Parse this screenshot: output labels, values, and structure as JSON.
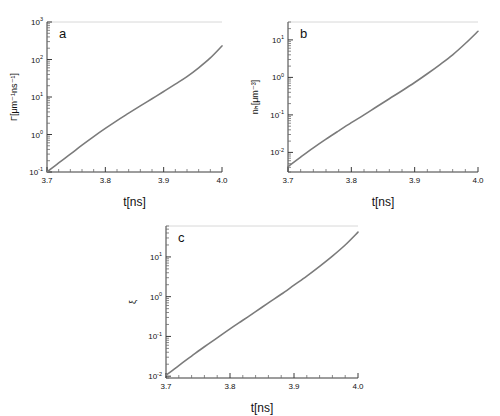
{
  "figure": {
    "background": "#ffffff",
    "curve_color": "#7b7b7b",
    "axis_color": "#3a3a3a",
    "panel_letters": [
      "a",
      "b",
      "c"
    ]
  },
  "chart_data": [
    {
      "type": "line",
      "panel": "a",
      "title": "",
      "xlabel": "t[ns]",
      "ylabel": "Γ[μm⁻¹ns⁻¹]",
      "xlim": [
        3.7,
        4.0
      ],
      "ylim": [
        0.1,
        1000
      ],
      "yscale": "log",
      "xscale": "linear",
      "grid": false,
      "legend": null,
      "xticks": [
        3.7,
        3.8,
        3.9,
        4.0
      ],
      "xticklabels": [
        "3.7",
        "3.8",
        "3.9",
        "4.0"
      ],
      "yticks": [
        0.1,
        1,
        10,
        100,
        1000
      ],
      "yticklabels": [
        "10⁻¹",
        "10⁰",
        "10¹",
        "10²",
        "10³"
      ],
      "x": [
        3.7,
        3.72,
        3.74,
        3.76,
        3.78,
        3.8,
        3.82,
        3.84,
        3.86,
        3.88,
        3.9,
        3.92,
        3.94,
        3.96,
        3.98,
        4.0
      ],
      "y": [
        0.1,
        0.175,
        0.3,
        0.52,
        0.88,
        1.45,
        2.35,
        3.7,
        5.8,
        9.0,
        14.0,
        22.0,
        35.0,
        60.0,
        110.0,
        230.0
      ]
    },
    {
      "type": "line",
      "panel": "b",
      "title": "",
      "xlabel": "t[ns]",
      "ylabel": "nₕ[μm⁻³]",
      "xlim": [
        3.7,
        4.0
      ],
      "ylim": [
        0.003,
        30
      ],
      "yscale": "log",
      "xscale": "linear",
      "grid": false,
      "legend": null,
      "xticks": [
        3.7,
        3.8,
        3.9,
        4.0
      ],
      "xticklabels": [
        "3.7",
        "3.8",
        "3.9",
        "4.0"
      ],
      "yticks": [
        0.01,
        0.1,
        1,
        10
      ],
      "yticklabels": [
        "10⁻²",
        "10⁻¹",
        "10⁰",
        "10¹"
      ],
      "x": [
        3.7,
        3.72,
        3.74,
        3.76,
        3.78,
        3.8,
        3.82,
        3.84,
        3.86,
        3.88,
        3.9,
        3.92,
        3.94,
        3.96,
        3.98,
        4.0
      ],
      "y": [
        0.0042,
        0.0075,
        0.0132,
        0.0225,
        0.0375,
        0.062,
        0.1,
        0.165,
        0.27,
        0.44,
        0.73,
        1.25,
        2.2,
        4.0,
        8.0,
        17.0
      ]
    },
    {
      "type": "line",
      "panel": "c",
      "title": "",
      "xlabel": "t[ns]",
      "ylabel": "ξ",
      "xlim": [
        3.7,
        4.0
      ],
      "ylim": [
        0.009,
        60
      ],
      "yscale": "log",
      "xscale": "linear",
      "grid": false,
      "legend": null,
      "xticks": [
        3.7,
        3.8,
        3.9,
        4.0
      ],
      "xticklabels": [
        "3.7",
        "3.8",
        "3.9",
        "4.0"
      ],
      "yticks": [
        0.01,
        0.1,
        1,
        10
      ],
      "yticklabels": [
        "10⁻²",
        "10⁻¹",
        "10⁰",
        "10¹"
      ],
      "x": [
        3.7,
        3.72,
        3.74,
        3.76,
        3.78,
        3.8,
        3.82,
        3.84,
        3.86,
        3.88,
        3.9,
        3.92,
        3.94,
        3.96,
        3.98,
        4.0
      ],
      "y": [
        0.0105,
        0.0185,
        0.032,
        0.055,
        0.092,
        0.155,
        0.255,
        0.42,
        0.7,
        1.15,
        1.95,
        3.3,
        5.8,
        10.5,
        20.0,
        42.0
      ]
    }
  ]
}
